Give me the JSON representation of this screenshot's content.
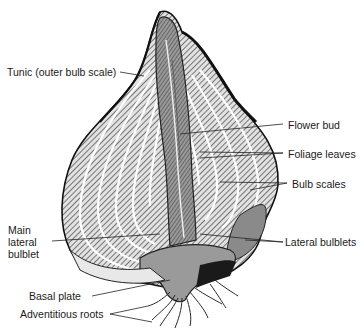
{
  "diagram": {
    "colors": {
      "background": "#ffffff",
      "outline": "#111111",
      "hatch": "#3a3a3a",
      "scale_fill": "#d9d9d9",
      "core_fill": "#8a8a8a",
      "basal_fill": "#9a9a9a",
      "tunic": "#111111",
      "gap": "#ffffff",
      "label_text": "#1a1a1a"
    },
    "labels": {
      "tunic": "Tunic (outer bulb scale)",
      "flower_bud": "Flower bud",
      "foliage_leaves": "Foliage leaves",
      "bulb_scales": "Bulb scales",
      "main_lateral_bulblet": "Main\nlateral\nbulblet",
      "lateral_bulblets": "Lateral bulblets",
      "basal_plate": "Basal plate",
      "adventitious_roots": "Adventitious roots"
    }
  }
}
